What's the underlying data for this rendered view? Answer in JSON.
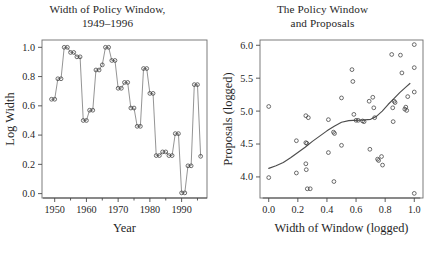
{
  "figure": {
    "background": "#ffffff",
    "marker_color": "#3d3d3d",
    "line_color": "#707070",
    "curve_color": "#4d4d4d",
    "frame_color": "#6e6e6e"
  },
  "panels": {
    "left": {
      "title_line1": "Width of Policy Window,",
      "title_line2": "1949–1996"
    },
    "right": {
      "title_line1": "The Policy Window",
      "title_line2": "and Proposals"
    }
  },
  "chart_data": [
    {
      "type": "line",
      "title": "Width of Policy Window, 1949–1996",
      "xlabel": "Year",
      "ylabel": "Log Width",
      "xlim": [
        1946,
        1998
      ],
      "ylim": [
        -0.03,
        1.05
      ],
      "grid": false,
      "legend": null,
      "xticks": [
        1950,
        1960,
        1970,
        1980,
        1990
      ],
      "xtick_labels": [
        "1950",
        "1960",
        "1970",
        "1980",
        "1990"
      ],
      "xminor_ticks": [
        1955,
        1965,
        1975,
        1985,
        1995
      ],
      "yticks": [
        0.0,
        0.2,
        0.4,
        0.6,
        0.8,
        1.0
      ],
      "ytick_labels": [
        "0.0",
        "0.2",
        "0.4",
        "0.6",
        "0.8",
        "1.0"
      ],
      "marker": "open-circle",
      "note": "Each congress contributes two overlapping point markers at the same value",
      "x": [
        1949,
        1950,
        1951,
        1952,
        1953,
        1954,
        1955,
        1956,
        1957,
        1958,
        1959,
        1960,
        1961,
        1962,
        1963,
        1964,
        1965,
        1966,
        1967,
        1968,
        1969,
        1970,
        1971,
        1972,
        1973,
        1974,
        1975,
        1976,
        1977,
        1978,
        1979,
        1980,
        1981,
        1982,
        1983,
        1984,
        1985,
        1986,
        1987,
        1988,
        1989,
        1990,
        1991,
        1992,
        1993,
        1994,
        1995,
        1996
      ],
      "values": [
        0.645,
        0.645,
        0.785,
        0.785,
        1.0,
        1.0,
        0.965,
        0.965,
        0.935,
        0.935,
        0.5,
        0.5,
        0.57,
        0.57,
        0.845,
        0.845,
        0.88,
        1.0,
        1.0,
        0.91,
        0.91,
        0.72,
        0.72,
        0.76,
        0.76,
        0.585,
        0.585,
        0.46,
        0.46,
        0.855,
        0.855,
        0.685,
        0.685,
        0.26,
        0.26,
        0.285,
        0.285,
        0.26,
        0.26,
        0.41,
        0.41,
        0.005,
        0.005,
        0.19,
        0.19,
        0.745,
        0.745,
        0.255
      ]
    },
    {
      "type": "scatter",
      "title": "The Policy Window and Proposals",
      "xlabel": "Width of Window (logged)",
      "ylabel": "Proposals (logged)",
      "xlim": [
        -0.06,
        1.06
      ],
      "ylim": [
        3.68,
        6.08
      ],
      "grid": false,
      "legend": null,
      "xticks": [
        0.0,
        0.2,
        0.4,
        0.6,
        0.8,
        1.0
      ],
      "xtick_labels": [
        "0.0",
        "0.2",
        "0.4",
        "0.6",
        "0.8",
        "1.0"
      ],
      "yticks": [
        4.0,
        4.5,
        5.0,
        5.5,
        6.0
      ],
      "ytick_labels": [
        "4.0",
        "4.5",
        "5.0",
        "5.5",
        "6.0"
      ],
      "marker": "open-circle",
      "points": [
        [
          0.0,
          5.07
        ],
        [
          0.0,
          3.99
        ],
        [
          0.19,
          4.55
        ],
        [
          0.19,
          4.06
        ],
        [
          0.255,
          4.93
        ],
        [
          0.272,
          4.9
        ],
        [
          0.255,
          4.52
        ],
        [
          0.262,
          4.51
        ],
        [
          0.255,
          4.2
        ],
        [
          0.258,
          4.11
        ],
        [
          0.265,
          3.82
        ],
        [
          0.285,
          3.82
        ],
        [
          0.41,
          4.87
        ],
        [
          0.41,
          4.37
        ],
        [
          0.445,
          4.68
        ],
        [
          0.452,
          4.66
        ],
        [
          0.448,
          3.93
        ],
        [
          0.5,
          5.2
        ],
        [
          0.5,
          4.48
        ],
        [
          0.572,
          5.63
        ],
        [
          0.578,
          5.45
        ],
        [
          0.585,
          4.95
        ],
        [
          0.6,
          4.86
        ],
        [
          0.615,
          4.86
        ],
        [
          0.645,
          4.85
        ],
        [
          0.655,
          4.84
        ],
        [
          0.69,
          5.15
        ],
        [
          0.695,
          4.42
        ],
        [
          0.715,
          5.21
        ],
        [
          0.722,
          5.05
        ],
        [
          0.728,
          4.9
        ],
        [
          0.748,
          4.27
        ],
        [
          0.755,
          4.25
        ],
        [
          0.775,
          4.31
        ],
        [
          0.782,
          4.18
        ],
        [
          0.845,
          5.86
        ],
        [
          0.862,
          5.15
        ],
        [
          0.868,
          5.13
        ],
        [
          0.852,
          5.05
        ],
        [
          0.855,
          4.84
        ],
        [
          0.905,
          5.85
        ],
        [
          0.915,
          5.58
        ],
        [
          0.935,
          5.03
        ],
        [
          0.942,
          5.06
        ],
        [
          0.948,
          5.01
        ],
        [
          0.955,
          5.22
        ],
        [
          1.0,
          6.01
        ],
        [
          1.0,
          5.66
        ],
        [
          1.0,
          5.29
        ],
        [
          1.0,
          3.75
        ]
      ],
      "smoother": {
        "name": "loess",
        "x": [
          0.0,
          0.05,
          0.1,
          0.15,
          0.2,
          0.25,
          0.3,
          0.35,
          0.4,
          0.45,
          0.5,
          0.55,
          0.58,
          0.62,
          0.66,
          0.7,
          0.74,
          0.78,
          0.82,
          0.86,
          0.9,
          0.94,
          0.97
        ],
        "y": [
          4.13,
          4.17,
          4.22,
          4.29,
          4.37,
          4.45,
          4.54,
          4.62,
          4.7,
          4.77,
          4.83,
          4.855,
          4.86,
          4.862,
          4.866,
          4.875,
          4.92,
          5.0,
          5.1,
          5.19,
          5.28,
          5.36,
          5.42
        ]
      }
    }
  ]
}
